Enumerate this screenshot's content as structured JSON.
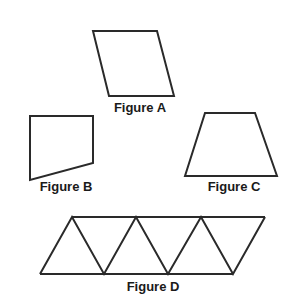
{
  "figures": [
    {
      "id": "A",
      "label": "Figure A",
      "shape": "parallelogram",
      "points": "93,31 157,31 174,96 109,96",
      "label_pos": [
        140,
        100
      ]
    },
    {
      "id": "B",
      "label": "Figure B",
      "shape": "quadrilateral",
      "points": "30,116 93,116 93,163 30,180",
      "label_pos": [
        66,
        179
      ]
    },
    {
      "id": "C",
      "label": "Figure C",
      "shape": "trapezoid",
      "points": "205,113 255,113 277,176 185,176",
      "label_pos": [
        234,
        179
      ]
    },
    {
      "id": "D",
      "label": "Figure D",
      "shape": "triangles-strip",
      "top_y": 217,
      "bottom_y": 274,
      "top_x": [
        72,
        136,
        201,
        265
      ],
      "bottom_x": [
        40,
        104,
        168,
        233
      ],
      "label_pos": [
        153,
        279
      ]
    }
  ],
  "stroke_color": "#2a2a2a"
}
